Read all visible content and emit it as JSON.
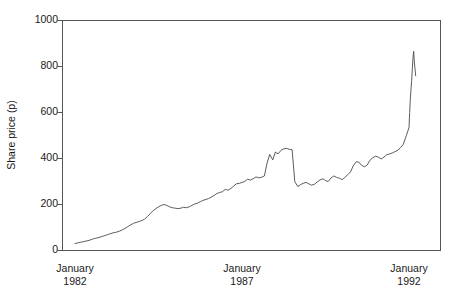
{
  "chart_data": {
    "type": "line",
    "title": "",
    "subtitle": "",
    "xlabel": "",
    "ylabel": "Share price (p)",
    "ylim": [
      0,
      1000
    ],
    "yticks": [
      0,
      200,
      400,
      600,
      800,
      1000
    ],
    "ytick_labels": [
      "0",
      "200",
      "400",
      "600",
      "800",
      "1000"
    ],
    "xlim": [
      1981.9,
      1992.2
    ],
    "xticks": [
      1982.0,
      1987.0,
      1992.0
    ],
    "xtick_labels": [
      {
        "month": "January",
        "year": "1982"
      },
      {
        "month": "January",
        "year": "1987"
      },
      {
        "month": "January",
        "year": "1992"
      }
    ],
    "grid": false,
    "legend": null,
    "line_color": "#4a4a4a",
    "axis_color": "#555555",
    "background": "#ffffff",
    "series": [
      {
        "name": "Share price",
        "units": "p",
        "x": [
          1982.0,
          1982.08,
          1982.17,
          1982.25,
          1982.33,
          1982.42,
          1982.5,
          1982.58,
          1982.67,
          1982.75,
          1982.83,
          1982.92,
          1983.0,
          1983.08,
          1983.17,
          1983.25,
          1983.33,
          1983.42,
          1983.5,
          1983.58,
          1983.67,
          1983.75,
          1983.83,
          1983.92,
          1984.0,
          1984.08,
          1984.17,
          1984.25,
          1984.33,
          1984.42,
          1984.5,
          1984.58,
          1984.67,
          1984.75,
          1984.83,
          1984.92,
          1985.0,
          1985.08,
          1985.17,
          1985.25,
          1985.33,
          1985.42,
          1985.5,
          1985.58,
          1985.67,
          1985.75,
          1985.83,
          1985.92,
          1986.0,
          1986.08,
          1986.17,
          1986.25,
          1986.33,
          1986.42,
          1986.5,
          1986.58,
          1986.67,
          1986.75,
          1986.83,
          1986.92,
          1987.0,
          1987.08,
          1987.17,
          1987.25,
          1987.33,
          1987.42,
          1987.5,
          1987.58,
          1987.67,
          1987.75,
          1987.83,
          1987.92,
          1988.0,
          1988.08,
          1988.17,
          1988.25,
          1988.33,
          1988.42,
          1988.5,
          1988.58,
          1988.67,
          1988.75,
          1988.83,
          1988.92,
          1989.0,
          1989.08,
          1989.17,
          1989.25,
          1989.33,
          1989.42,
          1989.5,
          1989.58,
          1989.67,
          1989.75,
          1989.83,
          1989.92,
          1990.0,
          1990.08,
          1990.17,
          1990.25,
          1990.33,
          1990.42,
          1990.5,
          1990.58,
          1990.67,
          1990.75,
          1990.83,
          1990.92,
          1991.0,
          1991.08,
          1991.17,
          1991.25,
          1991.33,
          1991.42,
          1991.5,
          1991.58,
          1991.67,
          1991.75,
          1991.83,
          1991.92,
          1992.0
        ],
        "values": [
          30,
          33,
          36,
          38,
          41,
          44,
          48,
          52,
          55,
          58,
          62,
          66,
          70,
          74,
          78,
          80,
          84,
          90,
          96,
          104,
          112,
          118,
          122,
          126,
          130,
          136,
          148,
          160,
          172,
          182,
          190,
          196,
          200,
          196,
          190,
          186,
          184,
          182,
          184,
          188,
          186,
          190,
          196,
          202,
          206,
          212,
          218,
          222,
          226,
          232,
          240,
          248,
          252,
          256,
          266,
          262,
          270,
          280,
          290,
          292,
          296,
          300,
          310,
          306,
          312,
          320,
          316,
          318,
          324,
          380,
          418,
          394,
          428,
          420,
          436,
          442,
          444,
          440,
          438,
          300,
          278,
          286,
          292,
          296,
          290,
          284,
          288,
          298,
          306,
          312,
          304,
          300,
          316,
          324,
          318,
          314,
          308,
          318,
          330,
          342,
          368,
          386,
          384,
          370,
          364,
          372,
          392,
          404,
          410,
          406,
          398,
          406,
          416,
          420,
          424,
          430,
          436,
          448,
          462,
          500,
          534
        ]
      }
    ],
    "series_tail": {
      "name": "Share price (continued)",
      "x": [
        1992.0,
        1992.02,
        1992.04,
        1992.06,
        1992.08,
        1992.1,
        1992.12,
        1992.14,
        1992.16,
        1992.18,
        1992.2
      ],
      "values": [
        534,
        600,
        660,
        700,
        740,
        790,
        840,
        866,
        820,
        790,
        760
      ]
    },
    "annotations": []
  },
  "axes": {
    "y_axis_label": "Share price (p)",
    "y_tick_0": "0",
    "y_tick_200": "200",
    "y_tick_400": "400",
    "y_tick_600": "600",
    "y_tick_800": "800",
    "y_tick_1000": "1000",
    "x_tick_1_month": "January",
    "x_tick_1_year": "1982",
    "x_tick_2_month": "January",
    "x_tick_2_year": "1987",
    "x_tick_3_month": "January",
    "x_tick_3_year": "1992"
  }
}
